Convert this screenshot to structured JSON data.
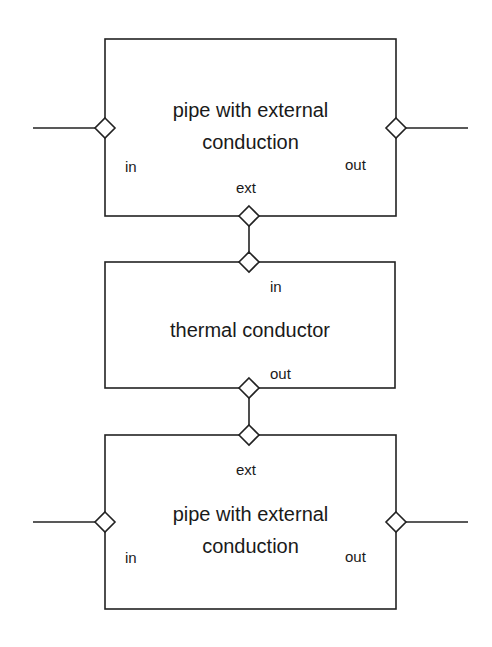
{
  "diagram": {
    "type": "block-diagram",
    "colors": {
      "stroke": "#222222",
      "background": "#ffffff"
    },
    "blocks": [
      {
        "id": "top_pipe",
        "title_line1": "pipe with external",
        "title_line2": "conduction",
        "ports": {
          "in": "in",
          "out": "out",
          "ext": "ext"
        }
      },
      {
        "id": "thermal",
        "title_line1": "thermal conductor",
        "ports": {
          "in": "in",
          "out": "out"
        }
      },
      {
        "id": "bottom_pipe",
        "title_line1": "pipe with external",
        "title_line2": "conduction",
        "ports": {
          "in": "in",
          "out": "out",
          "ext": "ext"
        }
      }
    ],
    "connections": [
      {
        "from": "top_pipe.ext",
        "to": "thermal.in"
      },
      {
        "from": "thermal.out",
        "to": "bottom_pipe.ext"
      }
    ]
  }
}
